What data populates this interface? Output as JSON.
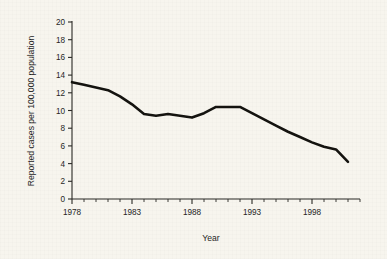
{
  "chart_data": {
    "type": "line",
    "title": "",
    "xlabel": "Year",
    "ylabel": "Reported cases per 100,000 population",
    "xlim": [
      1978,
      2001
    ],
    "ylim": [
      0,
      20
    ],
    "grid": false,
    "legend": "none",
    "y_ticks": [
      0,
      2,
      4,
      6,
      8,
      10,
      12,
      14,
      16,
      18,
      20
    ],
    "y_tick_labels": [
      "0",
      "2",
      "4",
      "6",
      "8",
      "10",
      "12",
      "14",
      "16",
      "18",
      "20"
    ],
    "x_ticks_major": [
      1978,
      1983,
      1988,
      1993,
      1998
    ],
    "x_tick_labels": [
      "1978",
      "1983",
      "1988",
      "1993",
      "1998"
    ],
    "x_minor_tick_interval": 1,
    "line_color": "#14130f",
    "background_color": "#f7f5ee",
    "x": [
      1978,
      1979,
      1980,
      1981,
      1982,
      1983,
      1984,
      1985,
      1986,
      1987,
      1988,
      1989,
      1990,
      1991,
      1992,
      1993,
      1994,
      1995,
      1996,
      1997,
      1998,
      1999,
      2000,
      2001
    ],
    "values": [
      13.2,
      12.9,
      12.6,
      12.3,
      11.6,
      10.7,
      9.6,
      9.4,
      9.6,
      9.4,
      9.2,
      9.7,
      10.4,
      10.4,
      10.4,
      9.7,
      9.0,
      8.3,
      7.6,
      7.0,
      6.4,
      5.9,
      5.6,
      4.2
    ],
    "series": [
      {
        "name": "Reported cases per 100,000 population",
        "values": [
          13.2,
          12.9,
          12.6,
          12.3,
          11.6,
          10.7,
          9.6,
          9.4,
          9.6,
          9.4,
          9.2,
          9.7,
          10.4,
          10.4,
          10.4,
          9.7,
          9.0,
          8.3,
          7.6,
          7.0,
          6.4,
          5.9,
          5.6,
          4.2
        ]
      }
    ]
  },
  "axes": {
    "x_title": "Year",
    "y_title": "Reported cases per 100,000 population"
  }
}
